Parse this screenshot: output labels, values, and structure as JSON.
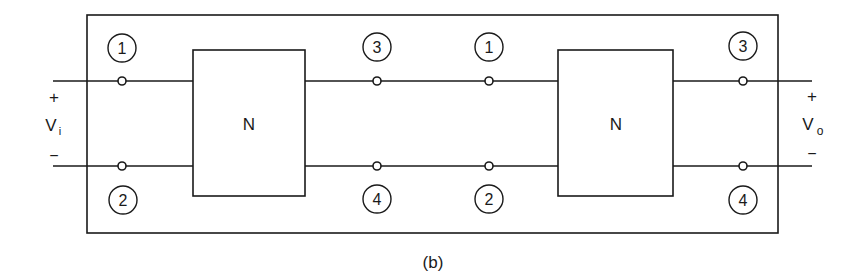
{
  "figure": {
    "caption": "(b)",
    "networks": [
      {
        "label": "N"
      },
      {
        "label": "N"
      }
    ],
    "port_labels": {
      "n1_top_left": "1",
      "n1_bottom_left": "2",
      "n1_top_right": "3",
      "n1_bottom_right": "4",
      "n2_top_left": "1",
      "n2_bottom_left": "2",
      "n2_top_right": "3",
      "n2_bottom_right": "4"
    },
    "input": {
      "plus": "+",
      "minus": "−",
      "symbol": "V",
      "subscript": "i"
    },
    "output": {
      "plus": "+",
      "minus": "−",
      "symbol": "V",
      "subscript": "o"
    }
  }
}
